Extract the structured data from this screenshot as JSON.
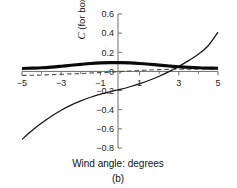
{
  "chart_data": {
    "type": "line",
    "title": "",
    "subtitle": "(b)",
    "xlabel": "Wind angle: degrees",
    "ylabel": "C (for box)",
    "ylabel_italic_part": "C",
    "ylabel_plain_part": " (for box)",
    "xlim": [
      -5,
      5
    ],
    "ylim": [
      -0.8,
      0.6
    ],
    "grid": false,
    "legend": "none",
    "xticks": [
      -5,
      -3,
      -1,
      1,
      3,
      5
    ],
    "xtick_labels": [
      "−5",
      "−3",
      "−1",
      "1",
      "3",
      "5"
    ],
    "xticks_minor": [
      -4,
      -2,
      0,
      2,
      4
    ],
    "yticks": [
      0.6,
      0.4,
      0.2,
      0,
      -0.2,
      -0.4,
      -0.6,
      -0.8
    ],
    "ytick_labels": [
      "0.6",
      "0.4",
      "0.2",
      "0",
      "−0.2",
      "−0.4",
      "−0.6",
      "−0.8"
    ],
    "x": [
      -5,
      -4.5,
      -4,
      -3.5,
      -3,
      -2.5,
      -2,
      -1.5,
      -1,
      -0.5,
      0,
      0.5,
      1,
      1.5,
      2,
      2.5,
      3,
      3.5,
      4,
      4.5,
      5
    ],
    "series": [
      {
        "name": "thick-flat-curve",
        "style": "solid-thick",
        "color": "#0a0a0a",
        "values": [
          0.031,
          0.034,
          0.038,
          0.045,
          0.054,
          0.064,
          0.074,
          0.083,
          0.089,
          0.092,
          0.092,
          0.089,
          0.083,
          0.075,
          0.066,
          0.057,
          0.049,
          0.043,
          0.038,
          0.035,
          0.033
        ]
      },
      {
        "name": "dashed-curve",
        "style": "dashed",
        "color": "#4c4c4c",
        "values": [
          -0.042,
          -0.04,
          -0.037,
          -0.034,
          -0.03,
          -0.026,
          -0.022,
          -0.017,
          -0.012,
          -0.007,
          -0.002,
          0.004,
          0.01,
          0.015,
          0.019,
          0.021,
          0.023,
          0.024,
          0.025,
          0.026,
          0.027
        ]
      },
      {
        "name": "thin-rising-curve",
        "style": "solid-thin",
        "color": "#151515",
        "values": [
          -0.71,
          -0.62,
          -0.54,
          -0.468,
          -0.405,
          -0.352,
          -0.308,
          -0.27,
          -0.238,
          -0.212,
          -0.188,
          -0.16,
          -0.128,
          -0.092,
          -0.05,
          -0.002,
          0.053,
          0.113,
          0.18,
          0.268,
          0.41
        ]
      }
    ]
  },
  "axis_labels": {
    "y_italic": "C",
    "y_rest": " (for box)",
    "x_title": "Wind angle: degrees",
    "panel_label": "(b)"
  },
  "colors": {
    "axis": "#6f6f6f",
    "thick_series": "#0a0a0a",
    "dashed_series": "#4c4c4c",
    "thin_series": "#151515",
    "background": "#ffffff",
    "text": "#111111"
  }
}
